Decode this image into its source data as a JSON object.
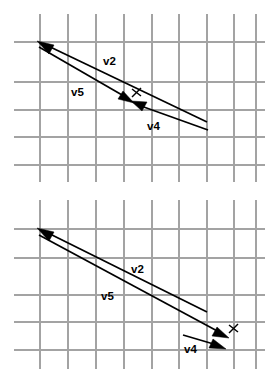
{
  "figure": {
    "background_color": "#ffffff",
    "grid_color": "#a3a3a3",
    "vector_color": "#000000",
    "width": 272,
    "height": 381,
    "panels": [
      {
        "id": "top-panel",
        "name": "vector-diagram-top",
        "grid": {
          "vertical_x": [
            40,
            68,
            96,
            124,
            152,
            179,
            207,
            234,
            256
          ],
          "horizontal_y": [
            42,
            82,
            110,
            137,
            165
          ],
          "x_extent": [
            14,
            265
          ],
          "y_extent": [
            14,
            182
          ]
        },
        "vectors": [
          {
            "name": "v2",
            "label": "v2",
            "label_x": 103,
            "label_y": 65,
            "from": [
              207,
              122
            ],
            "to": [
              40,
              43
            ],
            "arrow_at": "to",
            "arrow_angle_deg": 205
          },
          {
            "name": "v5",
            "label": "v5",
            "label_x": 71,
            "label_y": 96,
            "from": [
              40,
              47
            ],
            "to": [
              130,
              100
            ],
            "arrow_at": "to",
            "arrow_angle_deg": 30
          },
          {
            "name": "v4",
            "label": "v4",
            "label_x": 147,
            "label_y": 130,
            "from": [
              208,
              130
            ],
            "to": [
              134,
              103
            ],
            "arrow_at": "to",
            "arrow_angle_deg": 200
          }
        ],
        "markers": [
          {
            "name": "x-mark",
            "label": "x",
            "x": 136,
            "y": 92
          }
        ]
      },
      {
        "id": "bottom-panel",
        "name": "vector-diagram-bottom",
        "grid": {
          "vertical_x": [
            40,
            68,
            96,
            124,
            152,
            179,
            207,
            234,
            256
          ],
          "horizontal_y": [
            229,
            258,
            295,
            322,
            350
          ],
          "x_extent": [
            14,
            265
          ],
          "y_extent": [
            200,
            369
          ]
        },
        "vectors": [
          {
            "name": "v2",
            "label": "v2",
            "label_x": 131,
            "label_y": 273,
            "from": [
              207,
              312
            ],
            "to": [
              40,
              230
            ],
            "arrow_at": "to",
            "arrow_angle_deg": 206
          },
          {
            "name": "v5",
            "label": "v5",
            "label_x": 101,
            "label_y": 300,
            "from": [
              40,
              235
            ],
            "to": [
              228,
              337
            ],
            "arrow_at": "to",
            "arrow_angle_deg": 29
          },
          {
            "name": "v4",
            "label": "v4",
            "label_x": 184,
            "label_y": 353,
            "from": [
              183,
              335
            ],
            "to": [
              224,
              348
            ],
            "arrow_at": "to",
            "arrow_angle_deg": 18
          }
        ],
        "markers": [
          {
            "name": "x-mark",
            "label": "x",
            "x": 233,
            "y": 329
          }
        ]
      }
    ]
  }
}
